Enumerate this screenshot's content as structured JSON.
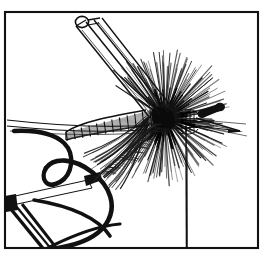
{
  "figure": {
    "title": "Fly tying step illustration",
    "caption": "",
    "medium": "pen-and-ink line drawing",
    "palette": {
      "ink": "#111111",
      "paper": "#ffffff",
      "mid_tone": "#3a3a3a",
      "light_tone": "#8a8a8a"
    },
    "frame": {
      "left": 5,
      "top": 12,
      "right": 258,
      "bottom": 248,
      "stroke_width": 2.0
    },
    "subjects": [
      {
        "name": "dry-fly",
        "label": "Dry fly on hook"
      },
      {
        "name": "hackle-collar",
        "label": "Radiating hackle collar"
      },
      {
        "name": "quill-body",
        "label": "Segmented quill body"
      },
      {
        "name": "hook",
        "label": "Hook with eye at right"
      },
      {
        "name": "hackle-pliers",
        "label": "Hackle pliers gripping feather tip"
      },
      {
        "name": "scissors-tool",
        "label": "Scissors / tool entering from upper left"
      },
      {
        "name": "hanging-thread",
        "label": "Tying thread hanging below hook"
      }
    ]
  },
  "geometry": {
    "hook_shank": {
      "x1": 14,
      "y1": 124,
      "x2": 232,
      "y2": 127
    },
    "hackle_center": {
      "cx": 165,
      "cy": 118,
      "r_outer": 66,
      "r_core": 13
    },
    "body_span": {
      "x1": 68,
      "y1": 131,
      "x2": 150,
      "y2": 118
    },
    "hanging_thread": {
      "x": 186,
      "y1": 128,
      "y2": 247
    },
    "hook_eye": {
      "x": 212,
      "y": 116
    },
    "pliers_loop": {
      "cx": 82,
      "cy": 22,
      "rx": 6.5,
      "ry": 5.5
    }
  },
  "hackle": {
    "barb_count": 150,
    "angle_start_deg": -145,
    "angle_end_deg": 145,
    "min_len": 24,
    "max_len": 68
  },
  "body_segments": {
    "count": 11,
    "hatch_per_segment": 7
  }
}
